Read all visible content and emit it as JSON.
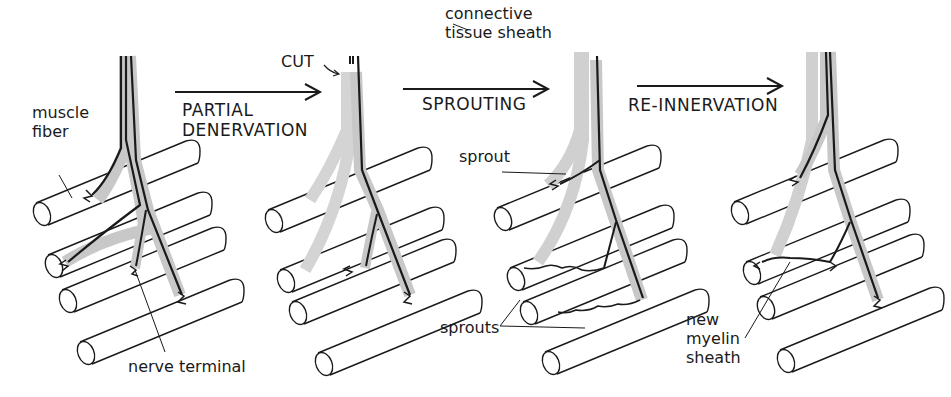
{
  "diagram": {
    "stages": [
      {
        "id": "normal",
        "description": "Intact motor nerve innervating four muscle fibers"
      },
      {
        "id": "partial-denervation",
        "description": "Some axons cut; their branches degenerate (grey sheaths remain)"
      },
      {
        "id": "sprouting",
        "description": "Surviving axon sends sprouts into vacated sheaths"
      },
      {
        "id": "re-innervation",
        "description": "Sprouts re-innervate denervated fibers, acquiring new myelin sheath"
      }
    ],
    "transitions": [
      {
        "label": "PARTIAL\nDENERVATION"
      },
      {
        "label": "SPROUTING"
      },
      {
        "label": "RE-INNERVATION"
      }
    ],
    "labels": {
      "muscle_fiber": "muscle\nfiber",
      "nerve_terminal": "nerve terminal",
      "cut": "CUT",
      "connective_tissue_sheath": "connective\ntissue sheath",
      "sprout": "sprout",
      "sprouts": "sprouts",
      "new_myelin_sheath": "new\nmyelin\nsheath"
    },
    "colors": {
      "ink": "#1a1a1a",
      "sheath_grey": "#c8c8c8",
      "background": "#ffffff"
    }
  }
}
